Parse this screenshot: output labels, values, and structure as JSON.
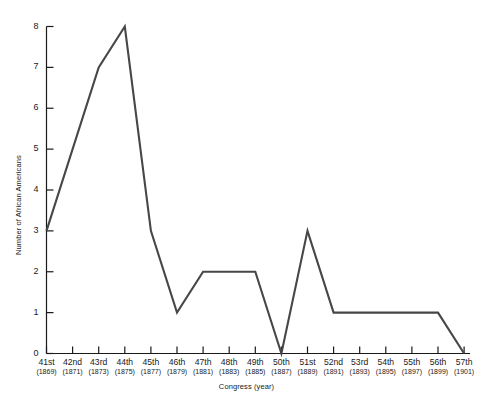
{
  "chart_data": {
    "type": "line",
    "title": "",
    "xlabel": "Congress (year)",
    "ylabel": "Number of African Americans",
    "xlim": [
      0,
      16
    ],
    "ylim": [
      0,
      8
    ],
    "grid": false,
    "legend": "none",
    "line_color": "#474747",
    "axis_color": "#1a1a1a",
    "categories": [
      "41st",
      "42nd",
      "43rd",
      "44th",
      "45th",
      "46th",
      "47th",
      "48th",
      "49th",
      "50th",
      "51st",
      "52nd",
      "53rd",
      "54th",
      "55th",
      "56th",
      "57th"
    ],
    "years": [
      "(1869)",
      "(1871)",
      "(1873)",
      "(1875)",
      "(1877)",
      "(1879)",
      "(1881)",
      "(1883)",
      "(1885)",
      "(1887)",
      "(1889)",
      "(1891)",
      "(1893)",
      "(1895)",
      "(1897)",
      "(1899)",
      "(1901)"
    ],
    "values": [
      3,
      5,
      7,
      8,
      3,
      1,
      2,
      2,
      2,
      0,
      3,
      1,
      1,
      1,
      1,
      1,
      0
    ],
    "ytick_labels": [
      "0",
      "1",
      "2",
      "3",
      "4",
      "5",
      "6",
      "7",
      "8"
    ],
    "ytick_values": [
      0,
      1,
      2,
      3,
      4,
      5,
      6,
      7,
      8
    ]
  }
}
